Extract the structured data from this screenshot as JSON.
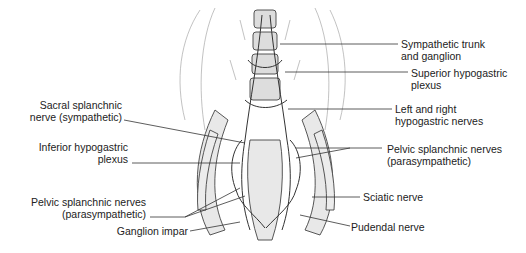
{
  "diagram": {
    "labels_right": [
      {
        "line1": "Sympathetic trunk",
        "line2": "and ganglion"
      },
      {
        "line1": "Superior hypogastric",
        "line2": "plexus"
      },
      {
        "line1": "Left and right",
        "line2": "hypogastric nerves"
      },
      {
        "line1": "Pelvic splanchnic nerves",
        "line2": "(parasympathetic)"
      },
      {
        "line1": "Sciatic nerve",
        "line2": ""
      },
      {
        "line1": "Pudendal nerve",
        "line2": ""
      }
    ],
    "labels_left": [
      {
        "line1": "Sacral splanchnic",
        "line2": "nerve (sympathetic)"
      },
      {
        "line1": "Inferior hypogastric",
        "line2": "plexus"
      },
      {
        "line1": "Pelvic splanchnic nerves",
        "line2": "(parasympathetic)"
      },
      {
        "line1": "Ganglion impar",
        "line2": ""
      }
    ],
    "colors": {
      "line": "#333333",
      "fill": "#e6e6e6",
      "text": "#222222"
    }
  }
}
